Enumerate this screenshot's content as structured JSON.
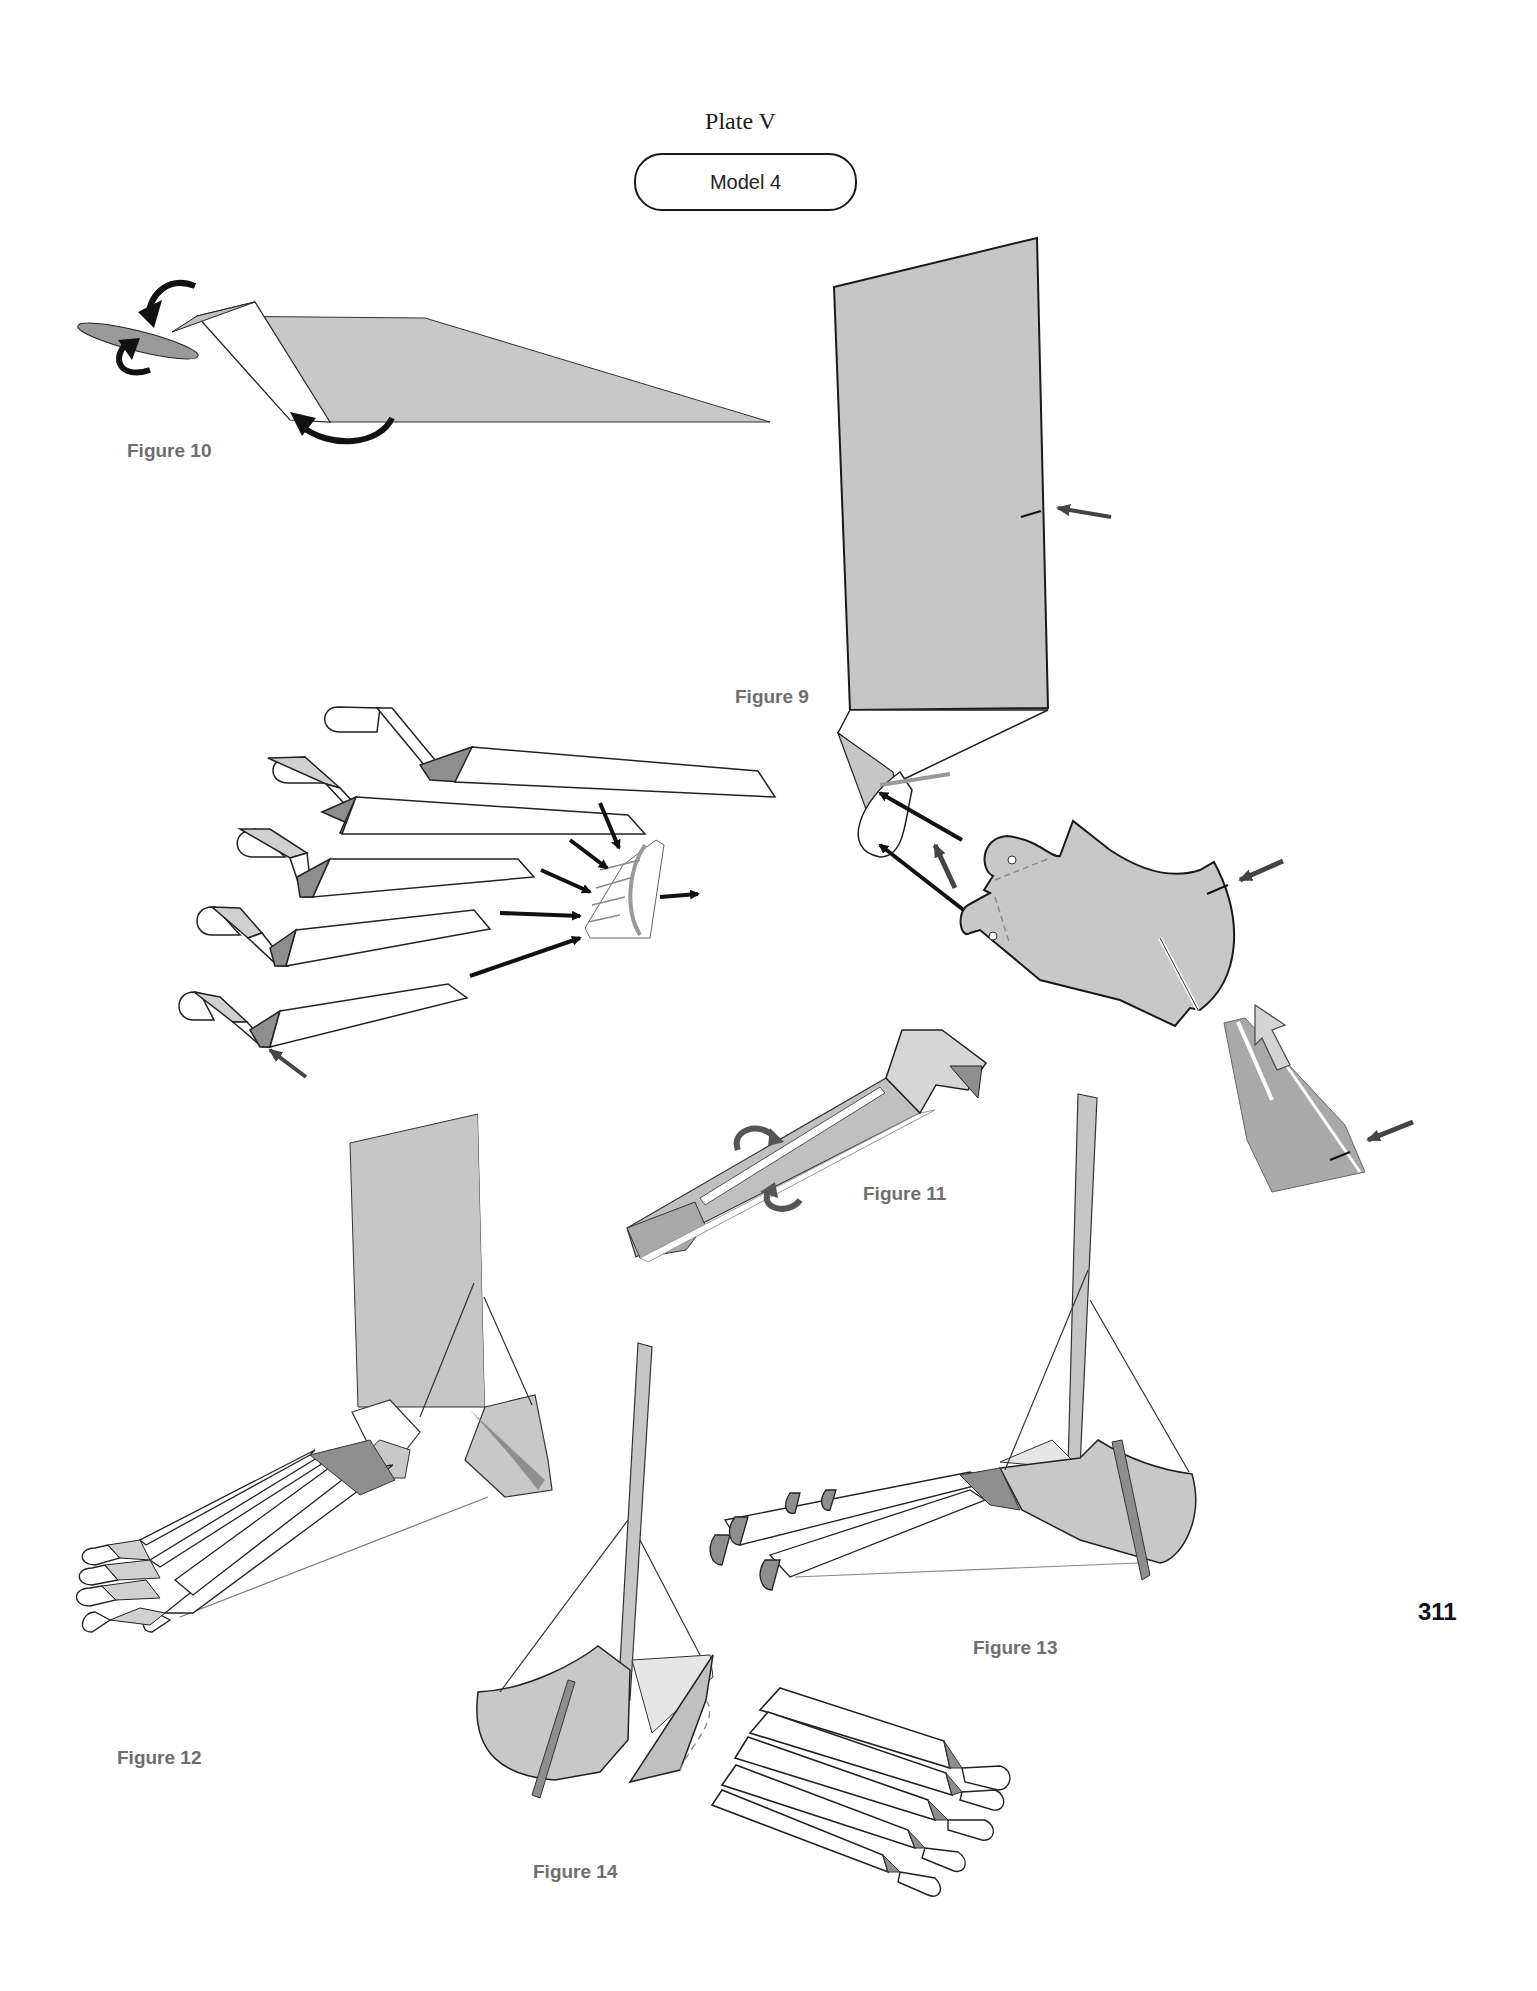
{
  "header": {
    "plate_title": "Plate V",
    "model_label": "Model 4"
  },
  "figures": [
    {
      "id": "figure-10",
      "label": "Figure 10",
      "description": "Long flat grey sheet being rolled at left end, curved fold arrows"
    },
    {
      "id": "figure-9",
      "label": "Figure 9",
      "description": "Exploded assembly: tall leg panel, five toe strips, metatarsal connector, heel piece, ankle flap, with insertion arrows"
    },
    {
      "id": "figure-11",
      "label": "Figure 11",
      "description": "Single folded toe strip with rotation arrows"
    },
    {
      "id": "figure-12",
      "label": "Figure 12",
      "description": "Assembled foot, side view with tall leg panel"
    },
    {
      "id": "figure-13",
      "label": "Figure 13",
      "description": "Assembled foot, rear three-quarter view"
    },
    {
      "id": "figure-14",
      "label": "Figure 14",
      "description": "Assembled foot, top view showing five toes"
    }
  ],
  "page_number": "311",
  "colors": {
    "paper_grey": "#c8c8c8",
    "paper_dark": "#8e8e8e",
    "paper_mid": "#a9a9a9",
    "outline": "#1a1a1a",
    "arrow": "#111111",
    "arrow_grey": "#555555",
    "label_grey": "#6e6e6e"
  }
}
